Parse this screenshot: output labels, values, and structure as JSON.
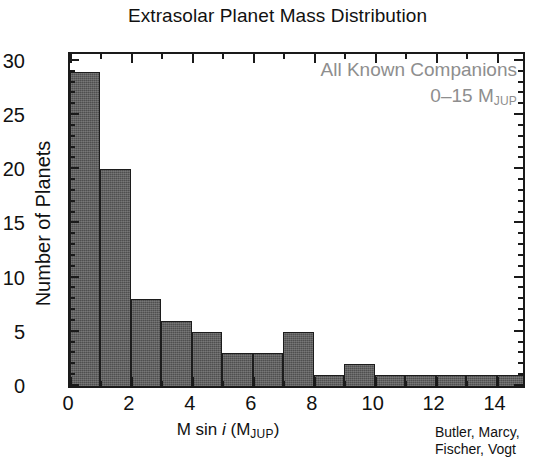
{
  "chart_data": {
    "type": "bar",
    "title": "Extrasolar Planet Mass Distribution",
    "xlabel": "M sin i (M_JUP)",
    "xlabel_parts": {
      "prefix": "M sin ",
      "italic": "i",
      "paren_open": " (M",
      "subscript": "JUP",
      "paren_close": ")"
    },
    "ylabel": "Number of Planets",
    "bin_width": 1,
    "bin_edges": [
      0,
      1,
      2,
      3,
      4,
      5,
      6,
      7,
      8,
      9,
      10,
      11,
      12,
      13,
      14,
      15
    ],
    "categories": [
      "0-1",
      "1-2",
      "2-3",
      "3-4",
      "4-5",
      "5-6",
      "6-7",
      "7-8",
      "8-9",
      "9-10",
      "10-11",
      "11-12",
      "12-13",
      "13-14",
      "14-15"
    ],
    "values": [
      29,
      20,
      8,
      6,
      5,
      3,
      3,
      5,
      1,
      2,
      1,
      1,
      1,
      1,
      1
    ],
    "xlim": [
      0,
      15
    ],
    "ylim": [
      0,
      31
    ],
    "xticks_major": [
      0,
      2,
      4,
      6,
      8,
      10,
      12,
      14
    ],
    "xticks_major_labels": [
      "0",
      "2",
      "4",
      "6",
      "8",
      "10",
      "12",
      "14"
    ],
    "xticks_minor": [
      1,
      3,
      5,
      7,
      9,
      11,
      13,
      15
    ],
    "yticks_major": [
      0,
      5,
      10,
      15,
      20,
      25,
      30
    ],
    "yticks_major_labels": [
      "0",
      "5",
      "10",
      "15",
      "20",
      "25",
      "30"
    ],
    "yticks_minor": [
      1,
      2,
      3,
      4,
      6,
      7,
      8,
      9,
      11,
      12,
      13,
      14,
      16,
      17,
      18,
      19,
      21,
      22,
      23,
      24,
      26,
      27,
      28,
      29,
      31
    ],
    "grid": false,
    "legend": null,
    "bar_color": "#4f4f4f",
    "bar_edge_color": "#1c1c1c",
    "frame_color": "#1a1a1a",
    "annotation_color": "#8e8e8e",
    "annotations": [
      {
        "text": "All Known Companions",
        "position": "top-right"
      },
      {
        "text": "0–15 M_JUP",
        "position": "top-right"
      }
    ]
  },
  "annotations": {
    "line1": "All Known Companions",
    "line2_prefix": "0–15 M",
    "line2_sub": "JUP"
  },
  "credit": {
    "line1": "Butler, Marcy,",
    "line2": "Fischer, Vogt"
  }
}
